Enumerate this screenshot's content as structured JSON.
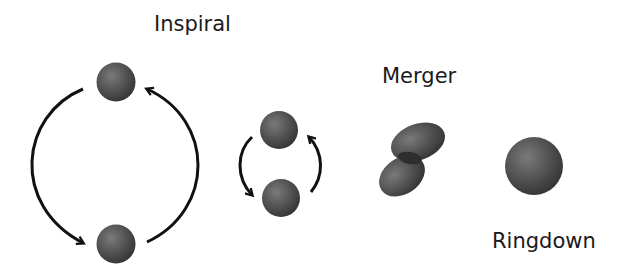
{
  "diagram": {
    "stages": [
      {
        "id": "inspiral",
        "label": "Inspiral"
      },
      {
        "id": "merger",
        "label": "Merger"
      },
      {
        "id": "ringdown",
        "label": "Ringdown"
      }
    ],
    "colors": {
      "sphere": "#4a4a4a",
      "sphere_highlight": "#7a7a7a",
      "arrow": "#111111",
      "text": "#1a1a1a",
      "background": "#ffffff"
    }
  }
}
